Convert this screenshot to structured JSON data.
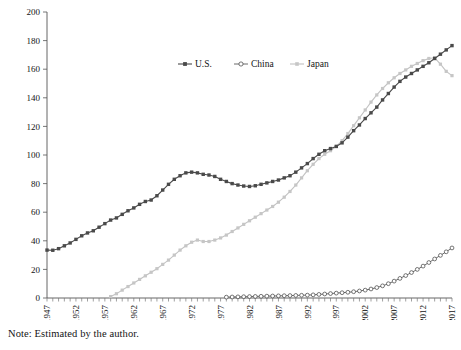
{
  "note": "Note: Estimated by the author.",
  "chart_data": {
    "type": "line",
    "title": "",
    "xlabel": "",
    "ylabel": "",
    "ylim": [
      0,
      200
    ],
    "ytick_step": 20,
    "yticks": [
      0,
      20,
      40,
      60,
      80,
      100,
      120,
      140,
      160,
      180,
      200
    ],
    "xlim": [
      1947,
      2017
    ],
    "xtick_labels": [
      "1947",
      "1952",
      "1957",
      "1962",
      "1967",
      "1972",
      "1977",
      "1982",
      "1987",
      "1992",
      "1997",
      "2002",
      "2007",
      "2012",
      "2017"
    ],
    "xtick_rotation": 90,
    "grid": false,
    "legend_position": "top-center",
    "x": [
      1947,
      1948,
      1949,
      1950,
      1951,
      1952,
      1953,
      1954,
      1955,
      1956,
      1957,
      1958,
      1959,
      1960,
      1961,
      1962,
      1963,
      1964,
      1965,
      1966,
      1967,
      1968,
      1969,
      1970,
      1971,
      1972,
      1973,
      1974,
      1975,
      1976,
      1977,
      1978,
      1979,
      1980,
      1981,
      1982,
      1983,
      1984,
      1985,
      1986,
      1987,
      1988,
      1989,
      1990,
      1991,
      1992,
      1993,
      1994,
      1995,
      1996,
      1997,
      1998,
      1999,
      2000,
      2001,
      2002,
      2003,
      2004,
      2005,
      2006,
      2007,
      2008,
      2009,
      2010,
      2011,
      2012,
      2013,
      2014,
      2015,
      2016,
      2017
    ],
    "series": [
      {
        "name": "U.S.",
        "marker": "filled-square",
        "color": "#4a4a4a",
        "values": [
          33.5,
          33.4,
          34.5,
          36.5,
          38.5,
          41.0,
          43.5,
          45.5,
          47.0,
          49.5,
          52.0,
          54.5,
          56.0,
          58.5,
          61.0,
          63.0,
          65.5,
          67.5,
          68.5,
          71.5,
          75.5,
          79.5,
          83.0,
          85.5,
          87.5,
          88.0,
          87.5,
          86.5,
          86.0,
          85.0,
          83.0,
          81.5,
          80.0,
          79.0,
          78.3,
          78.0,
          78.5,
          79.5,
          80.5,
          81.5,
          82.5,
          84.0,
          85.5,
          88.0,
          91.0,
          94.0,
          97.5,
          100.5,
          103.0,
          104.5,
          106.0,
          108.5,
          112.5,
          117.0,
          121.0,
          125.5,
          129.5,
          133.5,
          138.5,
          143.0,
          147.5,
          151.5,
          154.5,
          157.0,
          159.5,
          162.0,
          164.5,
          167.5,
          170.5,
          173.5,
          176.5
        ]
      },
      {
        "name": "China",
        "marker": "open-circle",
        "color": "#4a4a4a",
        "values": [
          0.0,
          0.0,
          0.0,
          0.0,
          0.0,
          0.0,
          0.0,
          0.0,
          0.0,
          0.0,
          0.0,
          0.0,
          0.0,
          0.0,
          0.0,
          0.0,
          0.0,
          0.0,
          0.0,
          0.0,
          0.0,
          0.0,
          0.0,
          0.0,
          0.0,
          0.0,
          0.0,
          0.0,
          0.0,
          0.0,
          0.0,
          0.6,
          0.7,
          0.8,
          0.9,
          1.0,
          1.1,
          1.2,
          1.3,
          1.4,
          1.5,
          1.6,
          1.7,
          1.8,
          1.9,
          2.0,
          2.2,
          2.5,
          2.8,
          3.1,
          3.4,
          3.7,
          4.0,
          4.4,
          4.9,
          5.5,
          6.3,
          7.3,
          8.5,
          10.0,
          11.8,
          13.7,
          15.7,
          17.8,
          20.0,
          22.3,
          24.8,
          27.3,
          29.8,
          32.3,
          35.0
        ]
      },
      {
        "name": "Japan",
        "marker": "filled-small",
        "color": "#c6c6c6",
        "values": [
          0.0,
          0.0,
          0.0,
          0.0,
          0.0,
          0.0,
          0.0,
          0.0,
          0.0,
          0.0,
          0.0,
          1.0,
          3.0,
          5.5,
          8.0,
          10.5,
          13.0,
          15.5,
          18.0,
          20.5,
          23.5,
          26.5,
          30.0,
          33.5,
          36.5,
          39.0,
          40.5,
          39.5,
          39.5,
          40.5,
          42.0,
          44.0,
          46.5,
          49.0,
          51.5,
          54.0,
          56.5,
          59.0,
          61.5,
          64.0,
          67.0,
          70.5,
          74.5,
          79.0,
          84.0,
          89.0,
          93.5,
          97.5,
          100.5,
          103.0,
          106.0,
          110.0,
          115.0,
          120.5,
          126.0,
          131.5,
          137.0,
          142.0,
          146.5,
          150.5,
          154.0,
          157.0,
          159.5,
          162.0,
          164.0,
          166.0,
          167.5,
          168.0,
          163.5,
          158.5,
          155.5
        ]
      }
    ]
  }
}
